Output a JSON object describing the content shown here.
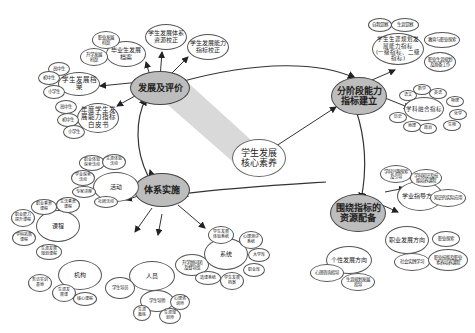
{
  "diagram": {
    "center": {
      "label": "学生发展核心素养",
      "lines": [
        "学生发展",
        "核心素养"
      ]
    },
    "hubs": [
      {
        "id": "eval",
        "lines": [
          "发展及评价"
        ]
      },
      {
        "id": "indicator",
        "lines": [
          "分阶段能力",
          "指标建立"
        ]
      },
      {
        "id": "resource",
        "lines": [
          "围绕指标的",
          "资源配备"
        ]
      },
      {
        "id": "implement",
        "lines": [
          "体系实施"
        ]
      }
    ],
    "nodes": {
      "eval_children": [
        {
          "lines": [
            "学生发展体系",
            "资源校正"
          ]
        },
        {
          "lines": [
            "学生发展能力",
            "指标校正"
          ]
        },
        {
          "lines": [
            "毕业生发展",
            "档案"
          ]
        },
        {
          "lines": [
            "职业发展",
            "档案"
          ]
        },
        {
          "lines": [
            "升学发展",
            "档案"
          ]
        },
        {
          "lines": [
            "学生发展档案"
          ]
        },
        {
          "lines": [
            "高中生"
          ]
        },
        {
          "lines": [
            "初中生"
          ]
        },
        {
          "lines": [
            "小学生"
          ]
        },
        {
          "lines": [
            "年度学生发",
            "展能力指标",
            "白皮书"
          ]
        },
        {
          "lines": [
            "高中生"
          ]
        },
        {
          "lines": [
            "初中生"
          ]
        },
        {
          "lines": [
            "小学生"
          ]
        }
      ],
      "indicator_children": [
        {
          "lines": [
            "学生生涯规划发",
            "展能力指标",
            "(一级指标、二级指标)"
          ]
        },
        {
          "lines": [
            "自我觉察"
          ]
        },
        {
          "lines": [
            "生涯觉察"
          ]
        },
        {
          "lines": [
            "教育与职业探索"
          ]
        },
        {
          "lines": [
            "职业生涯规划",
            "及准备工作"
          ]
        },
        {
          "lines": [
            "学科融合指标"
          ]
        },
        {
          "lines": [
            "语文"
          ]
        },
        {
          "lines": [
            "数学"
          ]
        },
        {
          "lines": [
            "英语"
          ]
        },
        {
          "lines": [
            "物理"
          ]
        },
        {
          "lines": [
            "化学"
          ]
        },
        {
          "lines": [
            "生物"
          ]
        },
        {
          "lines": [
            "政治"
          ]
        },
        {
          "lines": [
            "地理"
          ]
        },
        {
          "lines": [
            "历史"
          ]
        }
      ],
      "resource_children": [
        {
          "lines": [
            "学业指导方向"
          ]
        },
        {
          "lines": [
            "学科兴趣探索",
            "及引导"
          ]
        },
        {
          "lines": [
            "学科知识及技",
            "能培养课程"
          ]
        },
        {
          "lines": [
            "知识的实际应用"
          ]
        },
        {
          "lines": [
            "职业发展方向"
          ]
        },
        {
          "lines": [
            "职业探索"
          ]
        },
        {
          "lines": [
            "社会实践学习"
          ]
        },
        {
          "lines": [
            "职业技能及职业",
            "素养培养课程"
          ]
        },
        {
          "lines": [
            "个性发展方向"
          ]
        },
        {
          "lines": [
            "心理咨询指导"
          ]
        },
        {
          "lines": [
            "生涯规划发展",
            "指导"
          ]
        }
      ],
      "implement_children": [
        {
          "lines": [
            "活动"
          ]
        },
        {
          "lines": [
            "职业体验",
            "探索活动"
          ]
        },
        {
          "lines": [
            "生涯体验",
            "活动"
          ]
        },
        {
          "lines": [
            "学业探索",
            "活动"
          ]
        },
        {
          "lines": [
            "专家讲座"
          ]
        },
        {
          "lines": [
            "社团活动"
          ]
        },
        {
          "lines": [
            "课程"
          ]
        },
        {
          "lines": [
            "职业素养",
            "课程"
          ]
        },
        {
          "lines": [
            "生活素养",
            "课程"
          ]
        },
        {
          "lines": [
            "职业能力",
            "提升课程"
          ]
        },
        {
          "lines": [
            "学科拓展",
            "课程"
          ]
        },
        {
          "lines": [
            "生涯发展",
            "规划课程"
          ]
        },
        {
          "lines": [
            "机构"
          ]
        },
        {
          "lines": [
            "务访实训",
            "基地"
          ]
        },
        {
          "lines": [
            "生涯发",
            "展课"
          ]
        },
        {
          "lines": [
            "核心课程"
          ]
        },
        {
          "lines": [
            "人员"
          ]
        },
        {
          "lines": [
            "升学顾问团",
            "及督导组"
          ]
        },
        {
          "lines": [
            "学生导员"
          ]
        },
        {
          "lines": [
            "学生导师"
          ]
        },
        {
          "lines": [
            "心理咨",
            "询师"
          ]
        },
        {
          "lines": [
            "生涯",
            "教练"
          ]
        },
        {
          "lines": [
            "生涯规",
            "划师"
          ]
        },
        {
          "lines": [
            "系统"
          ]
        },
        {
          "lines": [
            "学生发展",
            "体验系统"
          ]
        },
        {
          "lines": [
            "心理测评",
            "系统"
          ]
        },
        {
          "lines": [
            "大学库"
          ]
        },
        {
          "lines": [
            "职业库"
          ]
        },
        {
          "lines": [
            "学生发展",
            "档案"
          ]
        },
        {
          "lines": [
            "选课系统"
          ]
        }
      ]
    },
    "colors": {
      "hub_fill": "#bdbdbd",
      "line": "#333333",
      "node_border": "#555555",
      "beam": "#d9d9d9"
    }
  }
}
